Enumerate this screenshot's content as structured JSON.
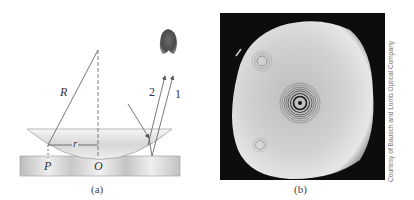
{
  "figure": {
    "panel_a": {
      "caption": "(a)",
      "labels": {
        "radius_of_curvature": "R",
        "radius": "r",
        "point_p": "P",
        "point_o": "O",
        "ray_1": "1",
        "ray_2": "2"
      }
    },
    "panel_b": {
      "caption": "(b)",
      "credit": "Courtesy of Bausch and Lomb Optical Company"
    },
    "colors": {
      "line": "#555555",
      "plate_light": "#e8e8e8",
      "plate_dark": "#bdbdbd",
      "photo_bg": "#0d0d0d",
      "photo_disk": "#c9c9c9",
      "eye": "#555555"
    }
  }
}
